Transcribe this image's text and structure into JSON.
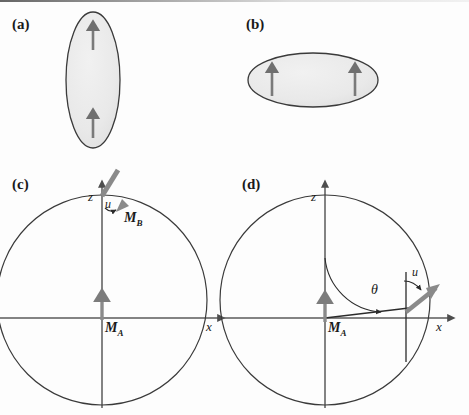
{
  "figure": {
    "type": "scientific-figure",
    "background_color": "#fdfdfd",
    "ellipse_fill": "#ebebeb",
    "ellipse_stroke": "#3a3a3a",
    "arrow_color": "#7a7a7a",
    "axis_color": "#555555",
    "circle_stroke": "#3a3a3a",
    "text_color": "#1a1a1a"
  },
  "panels": {
    "a": {
      "label": "(a)",
      "shape": "prolate-ellipse-vertical",
      "ellipse": {
        "cx": 93,
        "cy": 80,
        "rx": 27,
        "ry": 68
      },
      "arrows": [
        {
          "name": "spin-arrow-top",
          "x": 93,
          "y_tail": 50,
          "y_head": 24
        },
        {
          "name": "spin-arrow-bottom",
          "x": 93,
          "y_tail": 138,
          "y_head": 112
        }
      ]
    },
    "b": {
      "label": "(b)",
      "shape": "oblate-ellipse-horizontal",
      "ellipse": {
        "cx": 313,
        "cy": 80,
        "rx": 65,
        "ry": 27
      },
      "arrows": [
        {
          "name": "spin-arrow-left",
          "x": 272,
          "y_tail": 96,
          "y_head": 66
        },
        {
          "name": "spin-arrow-right",
          "x": 355,
          "y_tail": 96,
          "y_head": 66
        }
      ]
    },
    "c": {
      "label": "(c)",
      "axis_z": "z",
      "axis_x": "x",
      "magnetization_a": "M",
      "magnetization_a_sub": "A",
      "magnetization_b": "M",
      "magnetization_b_sub": "B",
      "displacement": "u",
      "circle": {
        "cx": 102,
        "cy": 300,
        "r": 105
      },
      "vector_MB": {
        "origin_x": 102,
        "origin_y": 195,
        "angle_deg": 45,
        "length": 32
      },
      "vector_MA": {
        "x": 102,
        "y_tail": 318,
        "y_head": 292
      }
    },
    "d": {
      "label": "(d)",
      "axis_z": "z",
      "axis_x": "x",
      "magnetization_a": "M",
      "magnetization_a_sub": "A",
      "displacement": "u",
      "angle": "θ",
      "circle": {
        "cx": 325,
        "cy": 300,
        "r": 105
      },
      "theta_deg": 62,
      "radius_contact": {
        "x": 406,
        "y": 312
      },
      "vector_u": {
        "angle_deg": 38,
        "length": 36
      }
    }
  }
}
